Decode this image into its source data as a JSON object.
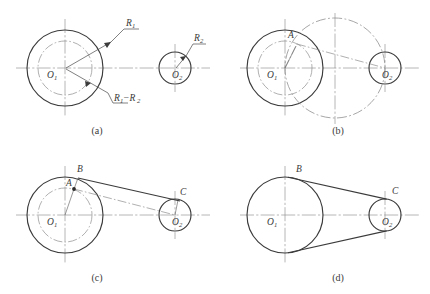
{
  "figure": {
    "stroke_color": "#3b3b3b",
    "construction_color": "#8a8a8a",
    "background": "#ffffff"
  },
  "panels": [
    {
      "id": "a",
      "caption": "(a)",
      "caption_pos": {
        "x": 97,
        "y": 134
      },
      "labels": {
        "center_big": "O",
        "center_big_sub": "1",
        "center_small": "O",
        "center_small_sub": "2",
        "radius_big": "R",
        "radius_big_sub": "1",
        "radius_small": "R",
        "radius_small_sub": "2",
        "radius_difference": "R",
        "radius_difference_sub": "1",
        "radius_difference_op": "−R",
        "radius_difference_sub2": "2"
      },
      "geometry": {
        "big_circle": {
          "cx": 65,
          "cy": 68,
          "r": 38
        },
        "inner_dashdot_circle": {
          "cx": 65,
          "cy": 68,
          "r": 27
        },
        "small_circle": {
          "cx": 175,
          "cy": 68,
          "r": 16
        }
      }
    },
    {
      "id": "b",
      "caption": "(b)",
      "caption_pos": {
        "x": 338,
        "y": 134
      },
      "labels": {
        "center_big": "O",
        "center_big_sub": "1",
        "center_small": "O",
        "center_small_sub": "2",
        "point_a": "A"
      },
      "geometry": {
        "big_circle": {
          "cx": 285,
          "cy": 68,
          "r": 38
        },
        "inner_dashdot_circle": {
          "cx": 285,
          "cy": 68,
          "r": 27
        },
        "small_circle": {
          "cx": 385,
          "cy": 68,
          "r": 16
        },
        "thales_circle": {
          "cx": 335,
          "cy": 68,
          "r": 50
        },
        "point_a": {
          "x": 297,
          "y": 44
        }
      }
    },
    {
      "id": "c",
      "caption": "(c)",
      "caption_pos": {
        "x": 97,
        "y": 281
      },
      "labels": {
        "center_big": "O",
        "center_big_sub": "1",
        "center_small": "O",
        "center_small_sub": "2",
        "point_a": "A",
        "point_b": "B",
        "point_c": "C"
      },
      "geometry": {
        "big_circle": {
          "cx": 65,
          "cy": 215,
          "r": 38
        },
        "inner_dashdot_circle": {
          "cx": 65,
          "cy": 215,
          "r": 27
        },
        "small_circle": {
          "cx": 175,
          "cy": 215,
          "r": 16
        },
        "point_a": {
          "x": 74,
          "y": 189
        },
        "point_b": {
          "x": 78,
          "y": 178
        },
        "point_c": {
          "x": 178,
          "y": 202
        }
      }
    },
    {
      "id": "d",
      "caption": "(d)",
      "caption_pos": {
        "x": 338,
        "y": 281
      },
      "labels": {
        "center_big": "O",
        "center_big_sub": "1",
        "center_small": "O",
        "center_small_sub": "2",
        "point_b": "B",
        "point_c": "C"
      },
      "geometry": {
        "big_circle": {
          "cx": 285,
          "cy": 215,
          "r": 38
        },
        "small_circle": {
          "cx": 385,
          "cy": 215,
          "r": 16
        },
        "tangent_b": {
          "x": 298,
          "y": 179
        },
        "tangent_c": {
          "x": 390,
          "y": 200
        }
      }
    }
  ]
}
